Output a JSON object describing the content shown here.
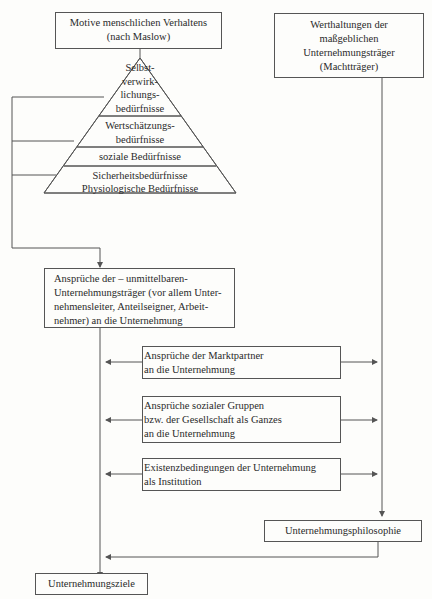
{
  "diagram": {
    "motive_box": {
      "line1": "Motive menschlichen Verhaltens",
      "line2": "(nach Maslow)"
    },
    "werthaltungen_box": {
      "line1": "Werthaltungen der",
      "line2": "maßgeblichen",
      "line3": "Unternehmungsträger",
      "line4": "(Machtträger)"
    },
    "pyramid": {
      "levels": [
        {
          "lines": [
            "Selbst-",
            "verwirk-",
            "lichungs-",
            "bedürfnisse"
          ]
        },
        {
          "lines": [
            "Wertschätzungs-",
            "bedürfnisse"
          ]
        },
        {
          "lines": [
            "soziale Bedürfnisse"
          ]
        },
        {
          "lines": [
            "Sicherheitsbedürfnisse"
          ]
        },
        {
          "lines": [
            "Physiologische Bedürfnisse"
          ]
        }
      ]
    },
    "ansprueche_traeger_box": {
      "line1": "Ansprüche der – unmittelbaren-",
      "line2": "Unternehmungsträger (vor allem Unter-",
      "line3": "nehmensleiter, Anteilseigner, Arbeit-",
      "line4": "nehmer) an die Unternehmung"
    },
    "marktpartner_box": {
      "line1": "Ansprüche der Marktpartner",
      "line2": "an die Unternehmung"
    },
    "soziale_gruppen_box": {
      "line1": "Ansprüche sozialer Gruppen",
      "line2": "bzw. der Gesellschaft als Ganzes",
      "line3": "an die Unternehmung"
    },
    "existenz_box": {
      "line1": "Existenzbedingungen der Unternehmung",
      "line2": "als Institution"
    },
    "philosophie_box": {
      "label": "Unternehmungsphilosophie"
    },
    "ziele_box": {
      "label": "Unternehmungsziele"
    }
  }
}
